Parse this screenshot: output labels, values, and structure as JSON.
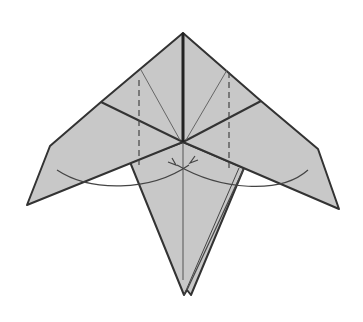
{
  "diagram": {
    "type": "origami-fold-step",
    "colors": {
      "paper": "#c8c8c8",
      "edge": "#333333",
      "crease": "#555555",
      "background": "#ffffff"
    },
    "annotations": {
      "valley_folds": 2,
      "arrows": [
        "swing-left-arrow",
        "swing-right-arrow"
      ]
    }
  }
}
